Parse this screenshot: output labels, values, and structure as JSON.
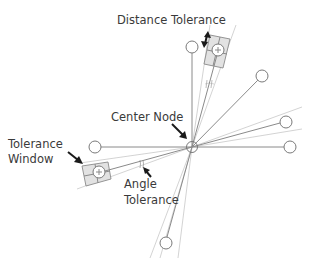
{
  "diagram": {
    "labels": {
      "distance_tolerance": "Distance Tolerance",
      "center_node": "Center Node",
      "tolerance_window_line1": "Tolerance",
      "tolerance_window_line2": "Window",
      "angle_tolerance_line1": "Angle",
      "angle_tolerance_line2": "Tolerance"
    },
    "nodes": [
      {
        "id": "center",
        "role": "center"
      },
      {
        "id": "top",
        "role": "neighbor"
      },
      {
        "id": "top-right-matched",
        "role": "matched-candidate"
      },
      {
        "id": "upper-right",
        "role": "neighbor"
      },
      {
        "id": "right-tilted",
        "role": "neighbor"
      },
      {
        "id": "right",
        "role": "neighbor"
      },
      {
        "id": "left",
        "role": "neighbor"
      },
      {
        "id": "left-lower-matched",
        "role": "matched-candidate"
      },
      {
        "id": "bottom",
        "role": "neighbor"
      }
    ],
    "colors": {
      "edge": "#8a8a8a",
      "guide": "#c8c8c8",
      "window_fill": "#e2e2e2",
      "arrow": "#1a1a1a",
      "text": "#3a3a3a"
    }
  }
}
